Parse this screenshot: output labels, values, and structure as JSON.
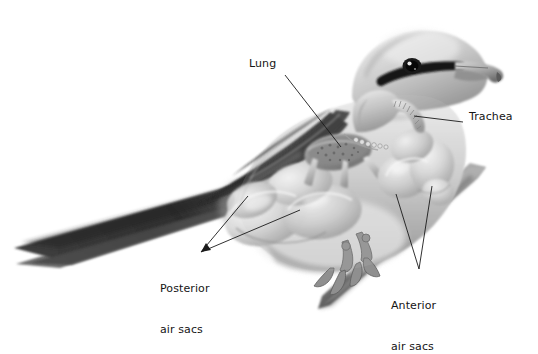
{
  "figure": {
    "background_color": "#ffffff",
    "text_color": "#151515",
    "style": "grayscale airbrush anatomical illustration"
  },
  "labels": [
    {
      "id": "lung",
      "text": "Lung",
      "lines": [
        "Lung"
      ],
      "x": 249,
      "y": 64,
      "leader": {
        "type": "line",
        "from": [
          285,
          75
        ],
        "to": [
          341,
          147
        ]
      }
    },
    {
      "id": "trachea",
      "text": "Trachea",
      "lines": [
        "Trachea"
      ],
      "x": 469,
      "y": 116,
      "leader": {
        "type": "line",
        "from": [
          463,
          122
        ],
        "to": [
          414,
          116
        ]
      }
    },
    {
      "id": "posterior-air-sacs",
      "text": "Posterior air sacs",
      "lines": [
        "Posterior",
        "air sacs"
      ],
      "x": 160,
      "y": 255,
      "leader": {
        "type": "arrow-fork",
        "tip": [
          201,
          252
        ],
        "to": [
          [
            248,
            196
          ],
          [
            300,
            210
          ]
        ]
      }
    },
    {
      "id": "anterior-air-sacs",
      "text": "Anterior air sacs",
      "lines": [
        "Anterior",
        "air sacs"
      ],
      "x": 391,
      "y": 272,
      "leader": {
        "type": "fork",
        "tip": [
          419,
          269
        ],
        "to": [
          [
            396,
            194
          ],
          [
            432,
            186
          ]
        ]
      }
    }
  ],
  "anatomy_parts": [
    "lung",
    "trachea",
    "anterior air sacs",
    "posterior air sacs",
    "interclavicular air sac",
    "bronchi"
  ],
  "bird": {
    "species_hint": "shrike",
    "features": [
      "hooked beak",
      "black eye mask",
      "dark wing",
      "long forked tail",
      "grasping feet"
    ],
    "perch": "diagonal branch"
  },
  "palette": {
    "body_light": "#e9e9e9",
    "body_mid": "#b9b9b9",
    "body_dark": "#6f6f6f",
    "wing_dark": "#3a3a3a",
    "tail_dark": "#2e2e2e",
    "branch": "#8d8d8d",
    "leader_line": "#1a1a1a"
  }
}
